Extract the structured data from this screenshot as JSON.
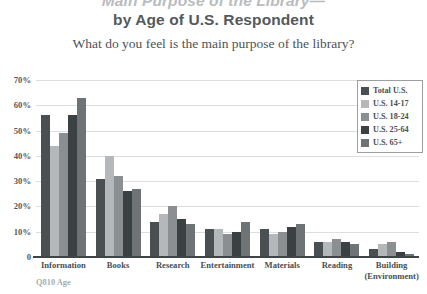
{
  "title": {
    "line1": "Main Purpose of the Library—",
    "line2": "by Age of U.S. Respondent"
  },
  "subtitle": "What do you feel is the main purpose of the library?",
  "footnote": "Q810 Age",
  "legend": {
    "position": "top-right",
    "entries": [
      {
        "label": "Total U.S.",
        "color": "#4a4f52"
      },
      {
        "label": "U.S. 14-17",
        "color": "#b4b8ba"
      },
      {
        "label": "U.S. 18-24",
        "color": "#8b8f92"
      },
      {
        "label": "U.S. 25-64",
        "color": "#3b4043"
      },
      {
        "label": "U.S. 65+",
        "color": "#6e7376"
      }
    ]
  },
  "yaxis": {
    "ticks": [
      "70%",
      "60%",
      "50%",
      "40%",
      "30%",
      "20%",
      "10%",
      "0"
    ],
    "min": 0,
    "max": 70
  },
  "xaxis": {
    "labels": [
      "Information",
      "Books",
      "Research",
      "Entertainment",
      "Materials",
      "Reading",
      "Building\n(Environment)"
    ]
  },
  "chart_data": {
    "type": "bar",
    "title": "Main Purpose of the Library— by Age of U.S. Respondent",
    "subtitle": "What do you feel is the main purpose of the library?",
    "xlabel": "",
    "ylabel": "",
    "ylim": [
      0,
      70
    ],
    "grid": true,
    "legend_position": "top-right",
    "categories": [
      "Information",
      "Books",
      "Research",
      "Entertainment",
      "Materials",
      "Reading",
      "Building (Environment)"
    ],
    "series": [
      {
        "name": "Total U.S.",
        "color": "#4a4f52",
        "values": [
          56,
          31,
          14,
          11,
          11,
          6,
          3
        ]
      },
      {
        "name": "U.S. 14-17",
        "color": "#b4b8ba",
        "values": [
          44,
          40,
          17,
          11,
          9,
          6,
          5
        ]
      },
      {
        "name": "U.S. 18-24",
        "color": "#8b8f92",
        "values": [
          49,
          32,
          20,
          9,
          10,
          7,
          6
        ]
      },
      {
        "name": "U.S. 25-64",
        "color": "#3b4043",
        "values": [
          56,
          26,
          15,
          10,
          12,
          6,
          2
        ]
      },
      {
        "name": "U.S. 65+",
        "color": "#6e7376",
        "values": [
          63,
          27,
          13,
          14,
          13,
          5,
          1
        ]
      }
    ],
    "units": "percent"
  }
}
